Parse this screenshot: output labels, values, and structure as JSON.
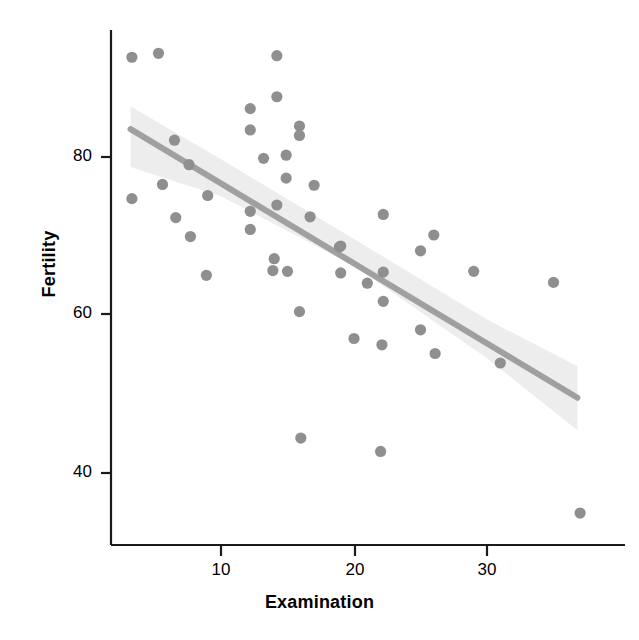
{
  "figure": {
    "background": "#ffffff",
    "point_color": "#8f8f8f",
    "line_color": "#a0a0a0",
    "band_color": "#ededed",
    "axis_color": "#1a1a1a"
  },
  "axes": {
    "x_title": "Examination",
    "y_title": "Fertility",
    "x_ticks": [
      "10",
      "20",
      "30"
    ],
    "y_ticks": [
      "80",
      "60",
      "40"
    ]
  },
  "chart_data": {
    "type": "scatter",
    "title": "",
    "xlabel": "Examination",
    "ylabel": "Fertility",
    "xlim": [
      2,
      38
    ],
    "ylim": [
      32,
      95
    ],
    "xticks": [
      10,
      20,
      30
    ],
    "yticks": [
      40,
      60,
      80
    ],
    "grid": false,
    "legend": null,
    "series": [
      {
        "name": "Swiss provinces",
        "marker": "circle",
        "color": "#8f8f8f",
        "points": [
          {
            "x": 3.3,
            "y": 92.5
          },
          {
            "x": 5.3,
            "y": 93.0
          },
          {
            "x": 14.2,
            "y": 92.7
          },
          {
            "x": 14.2,
            "y": 87.5
          },
          {
            "x": 12.2,
            "y": 86.0
          },
          {
            "x": 15.9,
            "y": 83.8
          },
          {
            "x": 15.9,
            "y": 82.6
          },
          {
            "x": 12.2,
            "y": 83.3
          },
          {
            "x": 6.5,
            "y": 82.0
          },
          {
            "x": 14.9,
            "y": 80.1
          },
          {
            "x": 13.2,
            "y": 79.7
          },
          {
            "x": 7.6,
            "y": 78.9
          },
          {
            "x": 14.9,
            "y": 77.2
          },
          {
            "x": 17.0,
            "y": 76.3
          },
          {
            "x": 5.6,
            "y": 76.4
          },
          {
            "x": 9.0,
            "y": 75.0
          },
          {
            "x": 3.3,
            "y": 74.6
          },
          {
            "x": 14.2,
            "y": 73.8
          },
          {
            "x": 12.2,
            "y": 73.0
          },
          {
            "x": 16.7,
            "y": 72.3
          },
          {
            "x": 6.6,
            "y": 72.2
          },
          {
            "x": 22.2,
            "y": 72.6
          },
          {
            "x": 12.2,
            "y": 70.7
          },
          {
            "x": 26.0,
            "y": 70.0
          },
          {
            "x": 7.7,
            "y": 69.8
          },
          {
            "x": 18.9,
            "y": 68.5
          },
          {
            "x": 19.0,
            "y": 68.6
          },
          {
            "x": 25.0,
            "y": 68.0
          },
          {
            "x": 14.0,
            "y": 67.0
          },
          {
            "x": 13.9,
            "y": 65.5
          },
          {
            "x": 15.0,
            "y": 65.4
          },
          {
            "x": 8.9,
            "y": 64.9
          },
          {
            "x": 19.0,
            "y": 65.2
          },
          {
            "x": 22.2,
            "y": 65.3
          },
          {
            "x": 29.0,
            "y": 65.4
          },
          {
            "x": 21.0,
            "y": 63.9
          },
          {
            "x": 35.0,
            "y": 64.0
          },
          {
            "x": 22.2,
            "y": 61.6
          },
          {
            "x": 15.9,
            "y": 60.3
          },
          {
            "x": 25.0,
            "y": 58.0
          },
          {
            "x": 20.0,
            "y": 56.9
          },
          {
            "x": 22.1,
            "y": 56.1
          },
          {
            "x": 26.1,
            "y": 55.0
          },
          {
            "x": 31.0,
            "y": 53.8
          },
          {
            "x": 16.0,
            "y": 44.3
          },
          {
            "x": 22.0,
            "y": 42.6
          },
          {
            "x": 37.0,
            "y": 34.8
          }
        ]
      }
    ],
    "fit": {
      "name": "linear regression",
      "color": "#a0a0a0",
      "x_start": 3.2,
      "x_end": 36.8,
      "y_start": 83.4,
      "y_end": 49.4
    },
    "confidence_band": {
      "color": "#ededed",
      "upper": [
        {
          "x": 3.2,
          "y": 86.3
        },
        {
          "x": 10.0,
          "y": 79.6
        },
        {
          "x": 20.0,
          "y": 69.5
        },
        {
          "x": 30.0,
          "y": 59.3
        },
        {
          "x": 36.8,
          "y": 53.4
        }
      ],
      "lower": [
        {
          "x": 3.2,
          "y": 78.6
        },
        {
          "x": 10.0,
          "y": 74.9
        },
        {
          "x": 20.0,
          "y": 66.1
        },
        {
          "x": 30.0,
          "y": 54.4
        },
        {
          "x": 36.8,
          "y": 45.3
        }
      ]
    }
  }
}
